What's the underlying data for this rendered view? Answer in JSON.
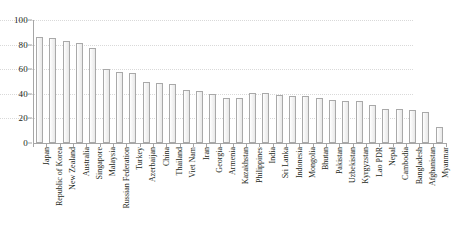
{
  "chart_data": {
    "type": "bar",
    "title": "",
    "subtitle": "",
    "xlabel": "",
    "ylabel": "",
    "ylim": [
      0,
      100
    ],
    "yticks": [
      0,
      20,
      40,
      60,
      80,
      100
    ],
    "grid": true,
    "legend": false,
    "legend_position": "none",
    "orientation": "vertical",
    "bar_fill_color": "#f2f2f2",
    "bar_border_color": "#a9a9a9",
    "axis_color": "#a6a6a6",
    "gridline_color": "#d9d9d9",
    "text_color": "#231f20",
    "categories": [
      "Japan",
      "Republic of Korea",
      "New Zealand",
      "Australia",
      "Singapore",
      "Malaysia",
      "Russian Federation",
      "Turkey",
      "Azerbaijan",
      "China",
      "Thailand",
      "Viet Nam",
      "Iran",
      "Georgia",
      "Armenia",
      "Kazakhstan",
      "Philippines",
      "India",
      "Sri Lanka",
      "Indonesia",
      "Mongolia",
      "Bhutan",
      "Pakistan",
      "Uzbekistan",
      "Kyrgyzstan",
      "Lao PDR",
      "Nepal",
      "Cambodia",
      "Bangladesh",
      "Afghanistan",
      "Myanmar"
    ],
    "values": [
      86,
      85,
      83,
      81,
      77,
      60,
      58,
      57,
      50,
      49,
      48,
      43,
      42,
      40,
      37,
      37,
      41,
      41,
      39,
      38,
      38,
      37,
      35,
      34,
      34,
      31,
      28,
      28,
      27,
      25,
      13
    ]
  }
}
